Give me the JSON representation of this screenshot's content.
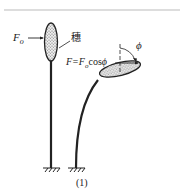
{
  "figure": {
    "left_plant": {
      "force_label": "F",
      "force_subscript": "o",
      "part_label": "穗"
    },
    "right_plant": {
      "force_formula": "F=F",
      "force_formula_subscript": "o",
      "force_formula_tail": "cos",
      "angle_symbol": "ϕ",
      "angle_label": "ϕ"
    },
    "caption": "(1)",
    "colors": {
      "stroke": "#222222",
      "rule": "#bbbbbb",
      "fill": "#dddddd"
    }
  }
}
